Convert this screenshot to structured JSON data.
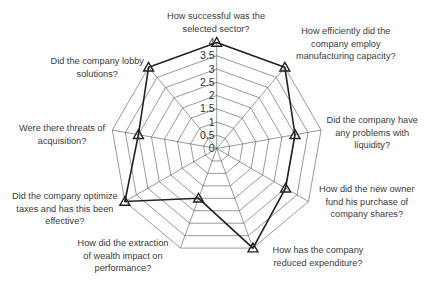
{
  "chart_data": {
    "type": "radar",
    "title": "",
    "categories": [
      "How successful was the selected sector?",
      "How efficiently did the company employ manufacturing capacity?",
      "Did the company have any problems with liquidity?",
      "How did the new owner fund his purchase of company shares?",
      "How has the company reduced expenditure?",
      "How did the extraction of wealth impact on performance?",
      "Did the company optimize taxes and has this been effective?",
      "Were there threats of acquisition?",
      "Did the company lobby solutions?"
    ],
    "series": [
      {
        "name": "Score",
        "values": [
          4,
          4,
          3,
          3,
          4,
          2,
          4,
          3,
          4
        ],
        "marker": "triangle",
        "color": "#222222"
      }
    ],
    "rlim": [
      0,
      4
    ],
    "rticks": [
      "0",
      "0.5",
      "1",
      "1.5",
      "2",
      "2.5",
      "3",
      "3.5",
      "4"
    ],
    "grid": true,
    "legend": "none"
  },
  "labels": [
    {
      "lines": [
        "How successful was the",
        "selected sector?"
      ],
      "x": 216,
      "y": 10
    },
    {
      "lines": [
        "How efficiently did the",
        "company employ",
        "manufacturing capacity?"
      ],
      "x": 346,
      "y": 25
    },
    {
      "lines": [
        "Did the company have",
        "any problems with",
        "liquidity?"
      ],
      "x": 372,
      "y": 114
    },
    {
      "lines": [
        "How did the new owner",
        "fund his purchase of",
        "company shares?"
      ],
      "x": 367,
      "y": 183
    },
    {
      "lines": [
        "How has the company",
        "reduced expenditure?"
      ],
      "x": 318,
      "y": 244
    },
    {
      "lines": [
        "How did the extraction",
        "of wealth impact on",
        "performance?"
      ],
      "x": 123,
      "y": 237
    },
    {
      "lines": [
        "Did the company optimize",
        "taxes and has this been",
        "effective?"
      ],
      "x": 65,
      "y": 190
    },
    {
      "lines": [
        "Were there threats of",
        "acquisition?"
      ],
      "x": 62,
      "y": 122
    },
    {
      "lines": [
        "Did the company lobby",
        "solutions?"
      ],
      "x": 97,
      "y": 55
    }
  ]
}
